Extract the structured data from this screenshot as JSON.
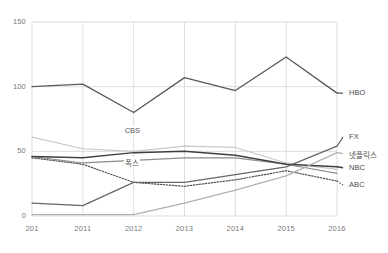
{
  "chart_data": {
    "type": "line",
    "title": "",
    "xlabel": "",
    "ylabel": "",
    "x": [
      "201",
      "2011",
      "2012",
      "2013",
      "2014",
      "2015",
      "2016"
    ],
    "xlim": [
      2010,
      2016
    ],
    "ylim": [
      0,
      150
    ],
    "yticks": [
      0,
      50,
      100,
      150
    ],
    "grid": true,
    "legend_position": "right-inline",
    "series": [
      {
        "name": "HBO",
        "label": "HBO",
        "color": "#595959",
        "style": "solid",
        "width": 1.3,
        "values": [
          100,
          102,
          80,
          107,
          97,
          123,
          95
        ]
      },
      {
        "name": "CBS",
        "label": "CBS",
        "color": "#c8c8c8",
        "style": "solid",
        "width": 1.2,
        "values": [
          61,
          52,
          50,
          54,
          53,
          41,
          36
        ]
      },
      {
        "name": "폭스",
        "label": "폭스",
        "color": "#8c8c8c",
        "style": "solid",
        "width": 1.2,
        "values": [
          46,
          41,
          43,
          45,
          45,
          40,
          33
        ]
      },
      {
        "name": "NBC",
        "label": "NBC",
        "color": "#404040",
        "style": "solid",
        "width": 1.5,
        "values": [
          46,
          45,
          49,
          50,
          47,
          40,
          38
        ]
      },
      {
        "name": "ABC",
        "label": "ABC",
        "color": "#4d4d4d",
        "style": "dotted",
        "width": 1.2,
        "values": [
          45,
          40,
          26,
          23,
          28,
          35,
          27
        ]
      },
      {
        "name": "FX",
        "label": "FX",
        "color": "#666666",
        "style": "solid",
        "width": 1.2,
        "values": [
          10,
          8,
          26,
          26,
          32,
          38,
          54
        ]
      },
      {
        "name": "넷플릭스",
        "label": "넷플릭스",
        "color": "#b0b0b0",
        "style": "solid",
        "width": 1.2,
        "values": [
          1,
          1,
          1,
          10,
          20,
          31,
          49
        ]
      }
    ],
    "inline_labels": [
      {
        "text": "CBS",
        "x": 2012.0,
        "y": 66
      },
      {
        "text": "폭스",
        "x": 2012.0,
        "y": 42
      }
    ],
    "end_labels": [
      {
        "text": "HBO",
        "series": "HBO"
      },
      {
        "text": "FX",
        "series": "FX"
      },
      {
        "text": "넷플릭스",
        "series": "넷플릭스"
      },
      {
        "text": "NBC",
        "series": "NBC"
      },
      {
        "text": "ABC",
        "series": "ABC"
      }
    ],
    "axis_colors": {
      "grid": "#dcdcdc",
      "tick_text": "#7a7a7a"
    }
  }
}
